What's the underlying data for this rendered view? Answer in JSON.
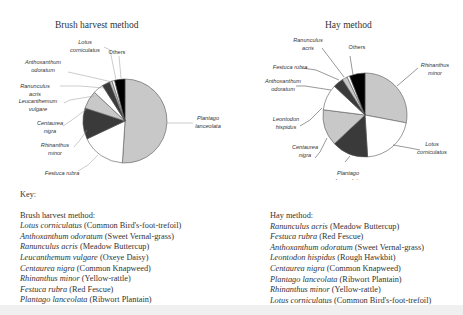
{
  "chart_data": [
    {
      "type": "pie",
      "title": "Brush harvest method",
      "start_angle": "12 o'clock, clockwise",
      "categories": [
        "Plantago lanceolata",
        "Festuca rubra",
        "Rhinanthus minor",
        "Centaurea nigra",
        "Leucanthemum vulgare",
        "Ranunculus acris",
        "Anthoxanthum odoratum",
        "Lotus corniculatus",
        "Others"
      ],
      "values": [
        51,
        17,
        12,
        7,
        4,
        3,
        1,
        1,
        4
      ],
      "colors": [
        "#c8c8c8",
        "#ffffff",
        "#3a3a3a",
        "#c8c8c8",
        "#ffffff",
        "#3a3a3a",
        "#c8c8c8",
        "#ffffff",
        "#000000"
      ],
      "labels": [
        {
          "lines": [
            "Plantago",
            "lanceolata"
          ],
          "italic": true
        },
        {
          "lines": [
            "Festuca rubra"
          ],
          "italic": true
        },
        {
          "lines": [
            "Rhinanthus",
            "minor"
          ],
          "italic": true
        },
        {
          "lines": [
            "Centaurea",
            "nigra"
          ],
          "italic": true
        },
        {
          "lines": [
            "Leucanthemum",
            "vulgare"
          ],
          "italic": true
        },
        {
          "lines": [
            "Ranunculus",
            "acris"
          ],
          "italic": true
        },
        {
          "lines": [
            "Anthoxanthum",
            "odoratum"
          ],
          "italic": true
        },
        {
          "lines": [
            "Lotus",
            "corniculatus"
          ],
          "italic": true
        },
        {
          "lines": [
            "Others"
          ],
          "italic": false
        }
      ]
    },
    {
      "type": "pie",
      "title": "Hay method",
      "start_angle": "12 o'clock, clockwise",
      "categories": [
        "Rhinanthus minor",
        "Lotus corniculatus",
        "Plantago lanceolata",
        "Centaurea nigra",
        "Leontodon hispidus",
        "Anthoxanthum odoratum",
        "Festuca rubra",
        "Ranunculus acris",
        "Others"
      ],
      "values": [
        28,
        21,
        14,
        14,
        10,
        4,
        2,
        1,
        6
      ],
      "colors": [
        "#c8c8c8",
        "#ffffff",
        "#3a3a3a",
        "#c8c8c8",
        "#ffffff",
        "#3a3a3a",
        "#c8c8c8",
        "#ffffff",
        "#000000"
      ],
      "labels": [
        {
          "lines": [
            "Rhinanthus",
            "minor"
          ],
          "italic": true
        },
        {
          "lines": [
            "Lotus",
            "corniculatus"
          ],
          "italic": true
        },
        {
          "lines": [
            "Plantago",
            "lanceolata"
          ],
          "italic": true
        },
        {
          "lines": [
            "Centaurea",
            "nigra"
          ],
          "italic": true
        },
        {
          "lines": [
            "Leontodon",
            "hispidus"
          ],
          "italic": true
        },
        {
          "lines": [
            "Anthoxanthum",
            "odoratum"
          ],
          "italic": true
        },
        {
          "lines": [
            "Festuca rubra"
          ],
          "italic": true
        },
        {
          "lines": [
            "Ranunculus",
            "acris"
          ],
          "italic": true
        },
        {
          "lines": [
            "Others"
          ],
          "italic": false
        }
      ]
    }
  ],
  "key": {
    "heading": "Key:",
    "brush": {
      "heading": "Brush harvest method:",
      "items": [
        {
          "latin": "Lotus corniculatus",
          "common": "(Common Bird's-foot-trefoil)"
        },
        {
          "latin": "Anthoxanthum odoratum",
          "common": "(Sweet Vernal-grass)"
        },
        {
          "latin": "Ranunculus acris",
          "common": "(Meadow Buttercup)"
        },
        {
          "latin": "Leucanthemum vulgare",
          "common": "(Oxeye Daisy)"
        },
        {
          "latin": "Centaurea nigra",
          "common": "(Common Knapweed)"
        },
        {
          "latin": "Rhinanthus minor",
          "common": "(Yellow-rattle)"
        },
        {
          "latin": "Festuca rubra",
          "common": "(Red Fescue)"
        },
        {
          "latin": "Plantago lanceolata",
          "common": "(Ribwort Plantain)"
        }
      ]
    },
    "hay": {
      "heading": "Hay method:",
      "items": [
        {
          "latin": "Ranunculus acris",
          "common": "(Meadow Buttercup)"
        },
        {
          "latin": "Festuca rubra",
          "common": "(Red Fescue)"
        },
        {
          "latin": "Anthoxanthum odoratum",
          "common": "(Sweet Vernal-grass)"
        },
        {
          "latin": "Leontodon hispidus",
          "common": "(Rough Hawkbit)"
        },
        {
          "latin": "Centaurea nigra",
          "common": "(Common Knapweed)"
        },
        {
          "latin": "Plantago lanceolata",
          "common": "(Ribwort Plantain)"
        },
        {
          "latin": "Rhinanthus minor",
          "common": "(Yellow-rattle)"
        },
        {
          "latin": "Lotus corniculatus",
          "common": "(Common Bird's-foot-trefoil)"
        }
      ]
    }
  }
}
